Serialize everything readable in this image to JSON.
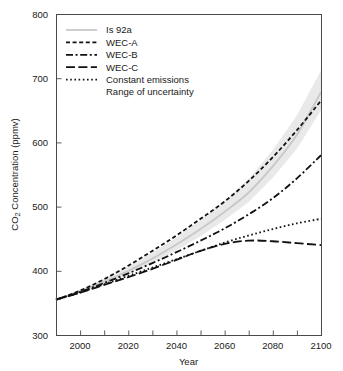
{
  "chart_data": {
    "type": "line",
    "title": "",
    "xlabel": "Year",
    "ylabel": "CO2 Concentration (ppmv)",
    "ylabel_parts": {
      "pre": "CO",
      "sub": "2",
      "post": " Concentration (ppmv)"
    },
    "xlim": [
      1990,
      2100
    ],
    "ylim": [
      300,
      800
    ],
    "x_ticks_major": [
      2000,
      2020,
      2040,
      2060,
      2080,
      2100
    ],
    "x_ticks_minor": [
      1990,
      2010,
      2030,
      2050,
      2070,
      2090
    ],
    "x_tick_labels": [
      "2000",
      "2020",
      "2040",
      "2060",
      "2080",
      "2100"
    ],
    "y_ticks": [
      300,
      400,
      500,
      600,
      700,
      800
    ],
    "y_tick_labels": [
      "300",
      "400",
      "500",
      "600",
      "700",
      "800"
    ],
    "grid": false,
    "legend_position": "top-left",
    "x": [
      1990,
      2000,
      2010,
      2020,
      2030,
      2040,
      2050,
      2060,
      2070,
      2080,
      2090,
      2100
    ],
    "series": [
      {
        "name": "Is 92a",
        "label": "Is 92a",
        "style": "solid",
        "color": "#c9c9c9",
        "values": [
          355,
          368,
          383,
          400,
          419,
          441,
          465,
          492,
          522,
          563,
          612,
          678
        ]
      },
      {
        "name": "WEC-A",
        "label": "WEC-A",
        "style": "dotted-dash",
        "color": "#111111",
        "values": [
          355,
          369,
          387,
          408,
          431,
          455,
          481,
          508,
          540,
          577,
          619,
          665
        ]
      },
      {
        "name": "WEC-B",
        "label": "WEC-B",
        "style": "dash-dot",
        "color": "#111111",
        "values": [
          355,
          367,
          381,
          396,
          412,
          429,
          447,
          466,
          488,
          513,
          544,
          580
        ]
      },
      {
        "name": "WEC-C",
        "label": "WEC-C",
        "style": "long-dash",
        "color": "#111111",
        "values": [
          355,
          366,
          378,
          390,
          403,
          417,
          431,
          442,
          447,
          446,
          443,
          440
        ]
      },
      {
        "name": "Constant emissions",
        "label": "Constant emissions",
        "style": "dotted",
        "color": "#111111",
        "values": [
          355,
          366,
          379,
          392,
          405,
          418,
          431,
          444,
          455,
          465,
          474,
          481
        ]
      }
    ],
    "band": {
      "label": "Range of uncertainty",
      "color": "#e9e9e9",
      "upper": [
        357,
        371,
        388,
        407,
        428,
        452,
        479,
        509,
        543,
        588,
        642,
        712
      ],
      "lower": [
        353,
        365,
        379,
        395,
        412,
        432,
        454,
        479,
        507,
        545,
        590,
        650
      ]
    },
    "legend": [
      {
        "label": "Is 92a",
        "swatch": "solid-gray"
      },
      {
        "label": "WEC-A",
        "swatch": "short-dash"
      },
      {
        "label": "WEC-B",
        "swatch": "dash-dot"
      },
      {
        "label": "WEC-C",
        "swatch": "long-dash"
      },
      {
        "label": "Constant emissions",
        "swatch": "dotted"
      },
      {
        "label": "Range of uncertainty",
        "swatch": "none"
      }
    ]
  }
}
